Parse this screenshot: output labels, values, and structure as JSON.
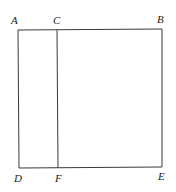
{
  "diagram": {
    "type": "geometry-figure",
    "points": [
      {
        "id": "A",
        "label": "A"
      },
      {
        "id": "C",
        "label": "C"
      },
      {
        "id": "B",
        "label": "B"
      },
      {
        "id": "D",
        "label": "D"
      },
      {
        "id": "F",
        "label": "F"
      },
      {
        "id": "E",
        "label": "E"
      }
    ],
    "segments": [
      {
        "from": "A",
        "to": "B"
      },
      {
        "from": "B",
        "to": "E"
      },
      {
        "from": "E",
        "to": "D"
      },
      {
        "from": "D",
        "to": "A"
      },
      {
        "from": "C",
        "to": "F"
      }
    ],
    "line_color": "#3a3a3a",
    "label_color": "#222222"
  }
}
